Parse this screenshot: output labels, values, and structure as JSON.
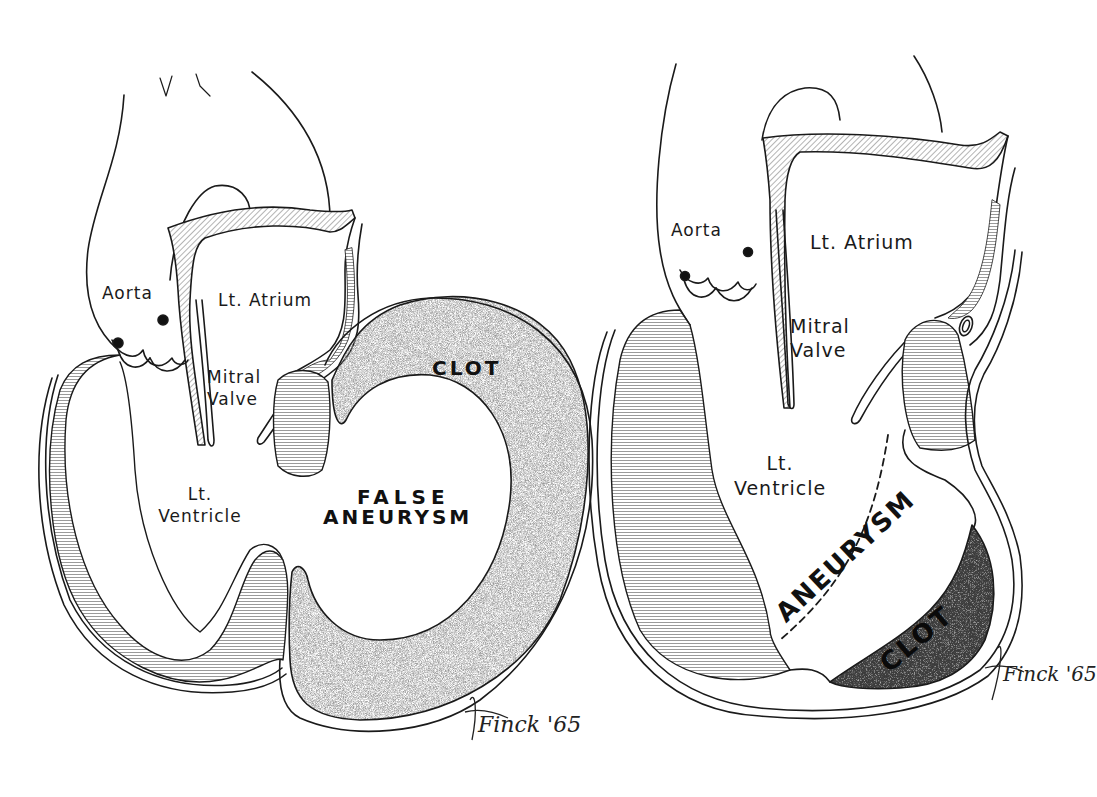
{
  "figure": {
    "panels": [
      {
        "id": "left",
        "title_hint": "False aneurysm of left ventricle",
        "labels": {
          "aorta": "Aorta",
          "lt_atrium": "Lt. Atrium",
          "mitral_valve_line1": "Mitral",
          "mitral_valve_line2": "Valve",
          "lt_ventricle_line1": "Lt.",
          "lt_ventricle_line2": "Ventricle",
          "clot": "CLOT",
          "false_aneurysm_line1": "FALSE",
          "false_aneurysm_line2": "ANEURYSM"
        },
        "signature": "Finck '65"
      },
      {
        "id": "right",
        "title_hint": "True aneurysm of left ventricle",
        "labels": {
          "aorta": "Aorta",
          "lt_atrium": "Lt. Atrium",
          "mitral_valve_line1": "Mitral",
          "mitral_valve_line2": "Valve",
          "lt_ventricle_line1": "Lt.",
          "lt_ventricle_line2": "Ventricle",
          "aneurysm": "ANEURYSM",
          "clot": "CLOT"
        },
        "signature": "Finck '65"
      }
    ],
    "colors": {
      "ink": "#1a1a1a",
      "background": "#ffffff",
      "clot_stipple": "#8a8a8a"
    }
  }
}
